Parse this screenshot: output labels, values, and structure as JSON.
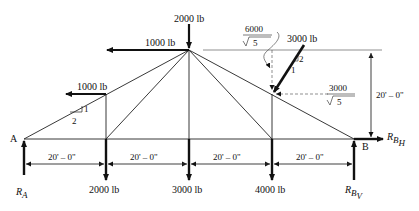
{
  "diagram": {
    "type": "truss-free-body",
    "supports": {
      "left": {
        "label": "A",
        "reaction": "R",
        "reaction_sub": "A"
      },
      "right": {
        "label": "B",
        "reaction_h": "R",
        "reaction_h_sub": "B",
        "reaction_h_subsub": "H",
        "reaction_v": "R",
        "reaction_v_sub": "B",
        "reaction_v_subsub": "V"
      }
    },
    "loads": {
      "top_vertical": "2000 lb",
      "top_horizontal": "1000 lb",
      "left_horizontal": "1000 lb",
      "bottom_1": "2000 lb",
      "bottom_2": "3000 lb",
      "bottom_3": "4000 lb",
      "inclined": "3000 lb",
      "component_vertical_num": "6000",
      "component_vertical_den": "5",
      "component_horizontal_num": "3000",
      "component_horizontal_den": "5"
    },
    "slopes": {
      "left_rise": "1",
      "left_run": "2",
      "inclined_rise": "2",
      "inclined_run": "1"
    },
    "dimensions": {
      "spans": [
        "20' – 0\"",
        "20' – 0\"",
        "20' – 0\"",
        "20' – 0\""
      ],
      "height": "20' – 0\""
    }
  }
}
